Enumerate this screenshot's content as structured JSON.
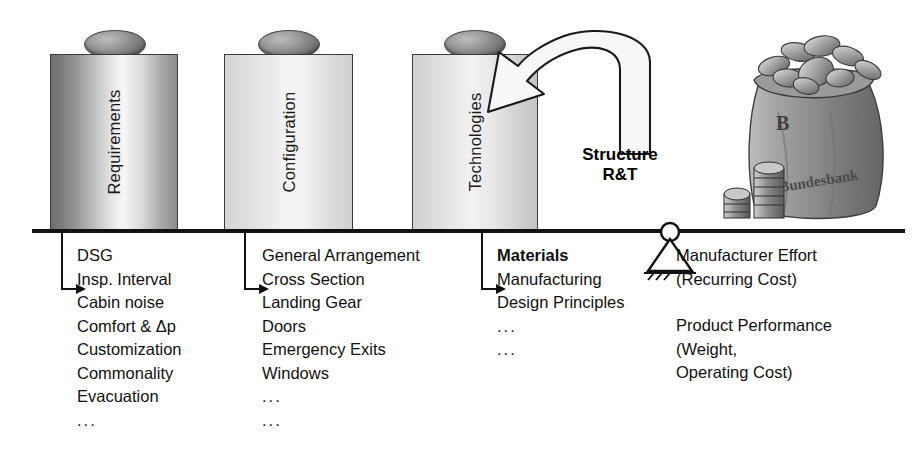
{
  "diagram": {
    "beam_label": "balance-beam",
    "pillars": [
      {
        "id": "requirements",
        "label": "Requirements",
        "shade": "dark"
      },
      {
        "id": "configuration",
        "label": "Configuration",
        "shade": "light"
      },
      {
        "id": "technologies",
        "label": "Technologies",
        "shade": "light"
      }
    ],
    "callout": {
      "line1": "Structure",
      "line2": "R&T",
      "arrow_name": "curved-feedback-arrow"
    },
    "money_bag": {
      "label": "Bundesbank",
      "initial": "B",
      "alt": "money bag full of coins with coin stacks"
    },
    "fulcrum": {
      "name": "pivot-support"
    },
    "columns": [
      {
        "id": "requirements",
        "items": [
          {
            "text": "DSG",
            "arrow": false,
            "bold": false
          },
          {
            "text": "Insp. Interval",
            "arrow": false,
            "bold": false
          },
          {
            "text": "Cabin noise",
            "arrow": true,
            "bold": false
          },
          {
            "text": "Comfort & Δp",
            "arrow": false,
            "bold": false
          },
          {
            "text": "Customization",
            "arrow": false,
            "bold": false
          },
          {
            "text": "Commonality",
            "arrow": false,
            "bold": false
          },
          {
            "text": "Evacuation",
            "arrow": false,
            "bold": false
          },
          {
            "text": "...",
            "arrow": false,
            "bold": false
          }
        ]
      },
      {
        "id": "configuration",
        "items": [
          {
            "text": "General Arrangement",
            "arrow": false,
            "bold": false
          },
          {
            "text": "Cross Section",
            "arrow": false,
            "bold": false
          },
          {
            "text": "Landing Gear",
            "arrow": true,
            "bold": false
          },
          {
            "text": "Doors",
            "arrow": false,
            "bold": false
          },
          {
            "text": "Emergency Exits",
            "arrow": false,
            "bold": false
          },
          {
            "text": "Windows",
            "arrow": false,
            "bold": false
          },
          {
            "text": "...",
            "arrow": false,
            "bold": false
          },
          {
            "text": "...",
            "arrow": false,
            "bold": false
          }
        ]
      },
      {
        "id": "technologies",
        "items": [
          {
            "text": "Materials",
            "arrow": false,
            "bold": true
          },
          {
            "text": "Manufacturing",
            "arrow": false,
            "bold": false
          },
          {
            "text": "Design Principles",
            "arrow": true,
            "bold": false
          },
          {
            "text": "...",
            "arrow": false,
            "bold": false
          },
          {
            "text": "...",
            "arrow": false,
            "bold": false
          }
        ]
      }
    ],
    "outputs": [
      {
        "line": "Manufacturer Effort"
      },
      {
        "line": "(Recurring Cost)"
      },
      {
        "line": ""
      },
      {
        "line": "Product Performance"
      },
      {
        "line": "(Weight,"
      },
      {
        "line": "Operating Cost)"
      }
    ],
    "colors": {
      "ink": "#111111",
      "beam": "#111111",
      "pillar_outline": "#3a3a3a"
    }
  }
}
